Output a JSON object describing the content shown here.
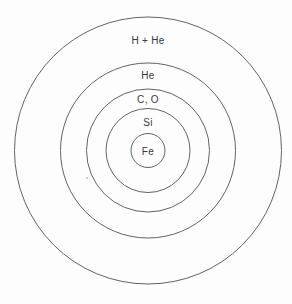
{
  "diagram": {
    "type": "concentric-shells",
    "background_color": "#fdfdfd",
    "stroke_color": "#636363",
    "text_color": "#3a3a3a",
    "center": {
      "x": 148,
      "y": 150.5
    },
    "shells": [
      {
        "label": "H + He",
        "radius": 133.5,
        "label_y": 44
      },
      {
        "label": "He",
        "radius": 87.5,
        "label_y": 79
      },
      {
        "label": "C, O",
        "radius": 61.5,
        "label_y": 103
      },
      {
        "label": "Si",
        "radius": 42,
        "label_y": 126
      },
      {
        "label": "Fe",
        "radius": 17,
        "label_y": 155
      }
    ],
    "artifact_dot": {
      "x": 87,
      "y": 178,
      "radius": 1,
      "color": "#b8b8b8"
    }
  }
}
